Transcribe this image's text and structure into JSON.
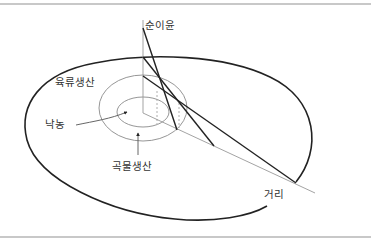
{
  "diagram": {
    "title": "",
    "labels": {
      "y_axis": "순이윤",
      "x_axis": "거리",
      "outer_zone": "육류생산",
      "inner_zone": "낙농",
      "middle_zone": "곡물생산"
    },
    "rent_lines": [
      {
        "name": "dairy",
        "label": "낙농"
      },
      {
        "name": "grain",
        "label": "곡물생산"
      },
      {
        "name": "meat",
        "label": "육류생산"
      }
    ],
    "colors": {
      "rule": "#c8c8c8",
      "outer_ellipse": "#222222",
      "rings": "#888888",
      "rent_lines": "#222222",
      "axis": "#999999",
      "text": "#333333"
    }
  }
}
